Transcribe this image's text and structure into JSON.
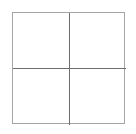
{
  "canvas": {
    "width": 136,
    "height": 134,
    "background_color": "#ffffff"
  },
  "figure": {
    "name": "2x2 grid square",
    "shape": "square",
    "rows": 2,
    "columns": 2,
    "cell_count": 4,
    "bounds": {
      "left": 12,
      "top": 12,
      "width": 113,
      "height": 112
    },
    "border": {
      "color": "#a6a6a6",
      "width_px": 1,
      "style": "solid"
    },
    "dividers": {
      "color": "#6e6e6e",
      "width_px": 1,
      "style": "solid",
      "vertical_x": 56,
      "horizontal_y": 55
    },
    "cells": [
      {
        "id": "top-left",
        "label": "",
        "fill": "#ffffff"
      },
      {
        "id": "top-right",
        "label": "",
        "fill": "#ffffff"
      },
      {
        "id": "bottom-left",
        "label": "",
        "fill": "#ffffff"
      },
      {
        "id": "bottom-right",
        "label": "",
        "fill": "#ffffff"
      }
    ]
  }
}
